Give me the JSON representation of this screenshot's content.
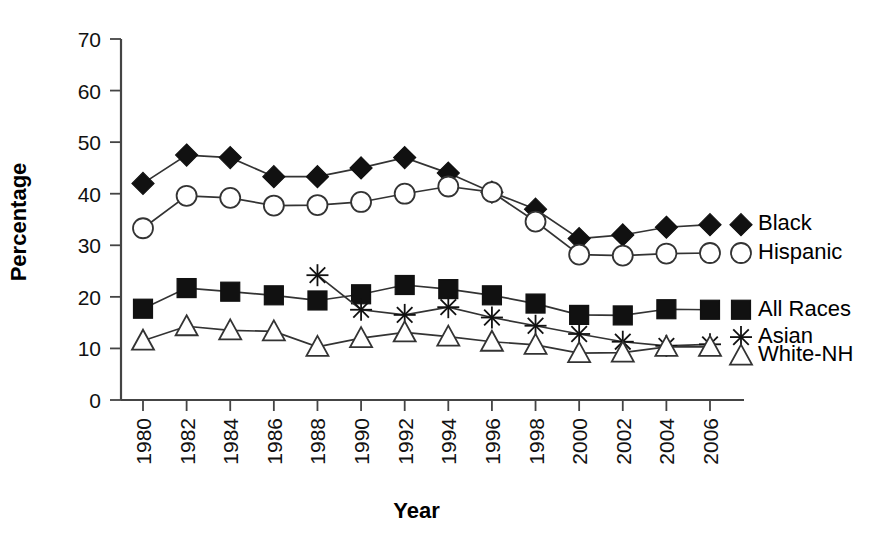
{
  "chart_data": {
    "type": "line",
    "title": "",
    "xlabel": "Year",
    "ylabel": "Percentage",
    "x": [
      1980,
      1982,
      1984,
      1986,
      1988,
      1990,
      1992,
      1994,
      1996,
      1998,
      2000,
      2002,
      2004,
      2006
    ],
    "xtick_labels": [
      "1980",
      "1982",
      "1984",
      "1986",
      "1988",
      "1990",
      "1992",
      "1994",
      "1996",
      "1998",
      "2000",
      "2002",
      "2004",
      "2006"
    ],
    "ytick_labels": [
      "0",
      "10",
      "20",
      "30",
      "40",
      "50",
      "60",
      "70"
    ],
    "yticks": [
      0,
      10,
      20,
      30,
      40,
      50,
      60,
      70
    ],
    "ylim": [
      0,
      70
    ],
    "xlim": [
      1980,
      2006
    ],
    "grid": false,
    "legend_position": "right-inline",
    "series": [
      {
        "name": "Black",
        "marker": "filled-diamond",
        "color": "#111111",
        "label_x": 2006,
        "label_y": 34,
        "values": [
          42,
          47.5,
          47,
          43.3,
          43.3,
          45,
          47,
          44,
          40.3,
          37,
          31.3,
          32,
          33.5,
          34
        ]
      },
      {
        "name": "Hispanic",
        "marker": "open-circle",
        "color": "#333333",
        "label_x": 2006,
        "label_y": 28.5,
        "values": [
          33.3,
          39.6,
          39.2,
          37.7,
          37.8,
          38.4,
          40,
          41.4,
          40.3,
          34.6,
          28.2,
          28,
          28.4,
          28.5
        ]
      },
      {
        "name": "All Races",
        "marker": "filled-square",
        "color": "#111111",
        "label_x": 2006,
        "label_y": 17.5,
        "values": [
          17.7,
          21.7,
          21,
          20.3,
          19.3,
          20.5,
          22.3,
          21.5,
          20.3,
          18.7,
          16.5,
          16.4,
          17.6,
          17.5
        ]
      },
      {
        "name": "Asian",
        "marker": "asterisk",
        "color": "#111111",
        "label_x": 2006,
        "label_y": 12.2,
        "values": [
          null,
          null,
          null,
          null,
          24.2,
          17.5,
          16.5,
          18,
          16,
          14.4,
          12.8,
          11.3,
          10.5,
          10.8
        ]
      },
      {
        "name": "White-NH",
        "marker": "open-triangle",
        "color": "#333333",
        "label_x": 2006,
        "label_y": 8.6,
        "values": [
          11.5,
          14.3,
          13.5,
          13.3,
          10.3,
          12,
          13.1,
          12.3,
          11.3,
          10.7,
          9.1,
          9.2,
          10.3,
          10.3
        ]
      }
    ]
  },
  "axis": {
    "x_title": "Year",
    "y_title": "Percentage"
  },
  "legend": {
    "items": [
      {
        "label": "Black",
        "marker": "filled-diamond"
      },
      {
        "label": "Hispanic",
        "marker": "open-circle"
      },
      {
        "label": "All Races",
        "marker": "filled-square"
      },
      {
        "label": "Asian",
        "marker": "asterisk"
      },
      {
        "label": "White-NH",
        "marker": "open-triangle"
      }
    ]
  }
}
